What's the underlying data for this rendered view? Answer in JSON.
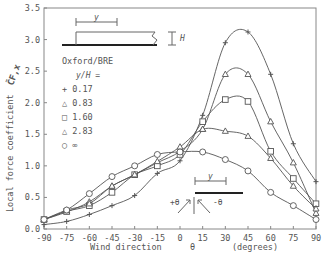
{
  "chart_data": {
    "type": "line",
    "title": "",
    "xlabel": "Wind direction   θ   (degrees)",
    "xlabel_parts": [
      "Wind direction",
      "θ",
      "(degrees)"
    ],
    "ylabel": "Local force coefficient",
    "ylabel_symbol": "C̃F,x",
    "xlim": [
      -90,
      90
    ],
    "ylim": [
      0,
      3.5
    ],
    "x_ticks": [
      -90,
      -75,
      -60,
      -45,
      -30,
      -15,
      0,
      15,
      30,
      45,
      60,
      75,
      90
    ],
    "y_ticks": [
      "0.0",
      "0.5",
      "1.0",
      "1.5",
      "2.0",
      "2.5",
      "3.0",
      "3.5"
    ],
    "grid": false,
    "legend": {
      "title": "Oxford/BRE",
      "subtitle": "y/H =",
      "position": "upper-left",
      "entries": [
        {
          "marker": "+",
          "label": "0.17"
        },
        {
          "marker": "△",
          "label": "0.83"
        },
        {
          "marker": "□",
          "label": "1.60"
        },
        {
          "marker": "△",
          "label": "2.83"
        },
        {
          "marker": "○",
          "label": "∞"
        }
      ]
    },
    "x": [
      -90,
      -75,
      -60,
      -45,
      -30,
      -15,
      0,
      15,
      30,
      45,
      60,
      75,
      90
    ],
    "series": [
      {
        "name": "0.17",
        "marker": "+",
        "values": [
          0.07,
          0.12,
          0.23,
          0.37,
          0.53,
          0.88,
          1.08,
          1.8,
          2.95,
          3.12,
          2.45,
          1.35,
          0.75
        ]
      },
      {
        "name": "0.83",
        "marker": "△",
        "values": [
          0.15,
          0.27,
          0.43,
          0.68,
          0.86,
          1.05,
          1.23,
          1.58,
          2.45,
          2.45,
          1.7,
          1.05,
          0.25
        ]
      },
      {
        "name": "1.60",
        "marker": "□",
        "values": [
          0.15,
          0.28,
          0.37,
          0.58,
          0.86,
          1.0,
          1.18,
          1.7,
          2.05,
          2.02,
          1.23,
          0.8,
          0.4
        ]
      },
      {
        "name": "2.83",
        "marker": "△",
        "values": [
          0.15,
          0.3,
          0.4,
          0.68,
          0.86,
          1.07,
          1.3,
          1.58,
          1.55,
          1.47,
          1.12,
          0.68,
          0.32
        ]
      },
      {
        "name": "∞",
        "marker": "○",
        "values": [
          0.15,
          0.3,
          0.56,
          0.83,
          1.0,
          1.18,
          1.22,
          1.22,
          1.1,
          0.92,
          0.58,
          0.37,
          0.15
        ]
      }
    ],
    "annotations": {
      "building_inset": {
        "y_label": "y",
        "h_label": "H"
      },
      "direction_inset": {
        "y_label": "y",
        "plus_label": "+θ",
        "minus_label": "-θ"
      }
    }
  },
  "axes": {
    "x_label_main": "Wind direction",
    "x_label_theta": "θ",
    "x_label_units": "(degrees)",
    "y_label_main": "Local force coefficient"
  },
  "legend": {
    "title": "Oxford/BRE",
    "subtitle": "y/H =",
    "items": [
      "+ 0.17",
      "△ 0.83",
      "□ 1.60",
      "△ 2.83",
      "○ ∞"
    ]
  },
  "colors": {
    "line": "#555555",
    "axis": "#777777",
    "text": "#555555",
    "heavy": "#222222"
  }
}
